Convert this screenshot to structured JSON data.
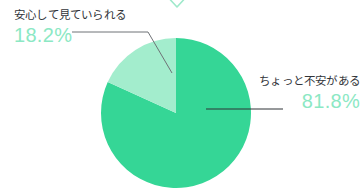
{
  "chart_data": {
    "type": "pie",
    "title": "",
    "categories": [
      "ちょっと不安がある",
      "安心して見ていられる"
    ],
    "values": [
      81.8,
      18.2
    ],
    "value_labels": [
      "81.8%",
      "18.2%"
    ],
    "unit": "%",
    "colors": [
      "#35d696",
      "#a3edcd"
    ],
    "legend": "none",
    "labels_inline": true,
    "start_angle_deg": 0,
    "direction": "clockwise",
    "slices": [
      {
        "name": "ちょっと不安がある",
        "value": 81.8,
        "value_label": "81.8%",
        "color": "#35d696",
        "label_position": "right"
      },
      {
        "name": "安心して見ていられる",
        "value": 18.2,
        "value_label": "18.2%",
        "color": "#a3edcd",
        "label_position": "top-left"
      }
    ]
  },
  "labels": {
    "left": {
      "title": "安心して見ていられる",
      "value": "18.2%"
    },
    "right": {
      "title": "ちょっと不安がある",
      "value": "81.8%"
    }
  },
  "icons": {
    "top_chevron": "chevron-down-icon"
  },
  "colors": {
    "slice_major": "#35d696",
    "slice_minor": "#a3edcd",
    "value_text": "#8ce8c4",
    "title_text": "#32353a",
    "leader_line": "#6e7276",
    "background": "#ffffff",
    "chevron": "#9fe9cb"
  }
}
